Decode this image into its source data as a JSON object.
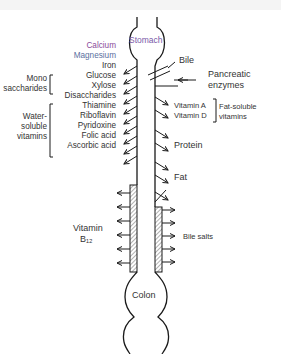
{
  "figure": {
    "type": "diagram",
    "colors": {
      "line": "#1a1a1a",
      "stomach_label": "#7a5aa8",
      "calcium_label": "#8a4b9a",
      "magnesium_label": "#5a6fa0",
      "background": "#ffffff"
    }
  },
  "organs": {
    "stomach": "Stomach",
    "colon": "Colon"
  },
  "secretions": {
    "bile": "Bile",
    "pancreatic_line1": "Pancreatic",
    "pancreatic_line2": "enzymes",
    "bile_salts": "Bile salts"
  },
  "left_absorbed": [
    "Calcium",
    "Magnesium",
    "Iron",
    "Glucose",
    "Xylose",
    "Disaccharides",
    "Thiamine",
    "Riboflavin",
    "Pyridoxine",
    "Folic acid",
    "Ascorbic acid"
  ],
  "groups": {
    "mono_line1": "Mono",
    "mono_line2": "saccharides",
    "water_line1": "Water-",
    "water_line2": "soluble",
    "water_line3": "vitamins",
    "fat_line1": "Fat-soluble",
    "fat_line2": "vitamins"
  },
  "right_absorbed": {
    "vitamin_a": "Vitamin A",
    "vitamin_d": "Vitamin D",
    "protein": "Protein",
    "fat": "Fat"
  },
  "ileum": {
    "b12_line1": "Vitamin",
    "b12_line2": "B₁₂"
  }
}
